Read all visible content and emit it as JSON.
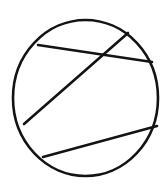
{
  "figure": {
    "kind": "geometry-diagram",
    "title": "Circle with three chords",
    "background_color": "#ffffff",
    "stroke_color": "#131313",
    "stroke_width": 2.6,
    "canvas": {
      "width": 168,
      "height": 185
    },
    "shapes": {
      "circle": {
        "name": "circle-outline",
        "cx": 85.5,
        "cy": 98,
        "rx": 72.5,
        "ry": 78
      },
      "chords": [
        {
          "name": "upper-chord",
          "x1": 38,
          "y1": 45,
          "x2": 152,
          "y2": 62
        },
        {
          "name": "diagonal-chord",
          "x1": 128,
          "y1": 33,
          "x2": 24,
          "y2": 124
        },
        {
          "name": "lower-chord",
          "x1": 43,
          "y1": 157,
          "x2": 157,
          "y2": 126
        }
      ],
      "intersections": [
        {
          "name": "upper-diagonal-crossing",
          "x": 98,
          "y": 58,
          "of": [
            "upper-chord",
            "diagonal-chord"
          ]
        }
      ]
    },
    "labels": [],
    "caption": ""
  }
}
